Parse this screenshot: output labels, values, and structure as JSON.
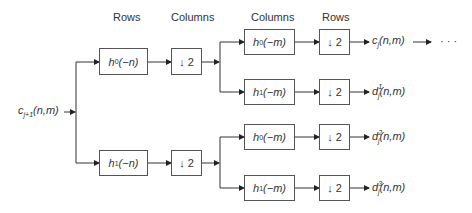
{
  "headers": [
    "Rows",
    "Columns",
    "Columns",
    "Rows"
  ],
  "input": {
    "base": "c",
    "sub": "j+1",
    "args": "(n,m)"
  },
  "stage1": [
    {
      "filter": "h",
      "sub": "0",
      "arg": "(−n)"
    },
    {
      "filter": "h",
      "sub": "1",
      "arg": "(−n)"
    }
  ],
  "downsample": "2",
  "stage2": [
    {
      "filter": "h",
      "sub": "0",
      "arg": "(−m)"
    },
    {
      "filter": "h",
      "sub": "1",
      "arg": "(−m)"
    },
    {
      "filter": "h",
      "sub": "0",
      "arg": "(−m)"
    },
    {
      "filter": "h",
      "sub": "1",
      "arg": "(−m)"
    }
  ],
  "outputs": [
    {
      "base": "c",
      "sub": "j",
      "sup": "",
      "args": "(n,m)"
    },
    {
      "base": "d",
      "sub": "j",
      "sup": "1",
      "args": "(n,m)"
    },
    {
      "base": "d",
      "sub": "j",
      "sup": "2",
      "args": "(n,m)"
    },
    {
      "base": "d",
      "sub": "j",
      "sup": "3",
      "args": "(n,m)"
    }
  ],
  "continuation": "· · ·"
}
